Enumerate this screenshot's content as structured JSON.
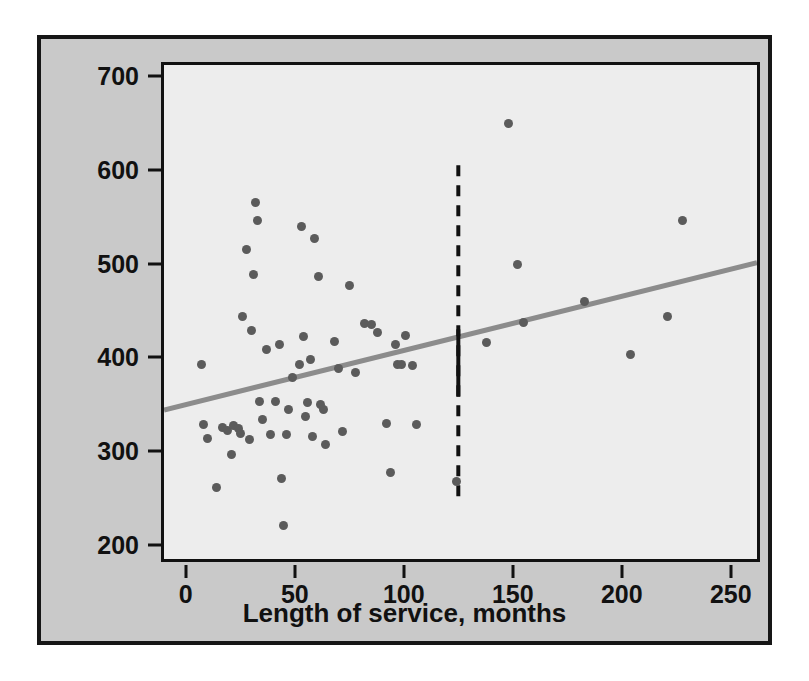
{
  "chart_data": {
    "type": "scatter",
    "title": "",
    "xlabel": "Length of service, months",
    "ylabel": "Weekly earnings, dollars",
    "xlim": [
      -10,
      262
    ],
    "ylim": [
      185,
      712
    ],
    "xticks": [
      0,
      50,
      100,
      150,
      200,
      250
    ],
    "yticks": [
      200,
      300,
      400,
      500,
      600,
      700
    ],
    "grid": false,
    "legend": "none",
    "point_color": "#5b5b5b",
    "background_color": "#ededed",
    "frame_color": "#c9c9c9",
    "axis_color": "#111111",
    "points": [
      {
        "x": 7,
        "y": 393
      },
      {
        "x": 8,
        "y": 328
      },
      {
        "x": 10,
        "y": 314
      },
      {
        "x": 14,
        "y": 261
      },
      {
        "x": 17,
        "y": 325
      },
      {
        "x": 19,
        "y": 322
      },
      {
        "x": 21,
        "y": 296
      },
      {
        "x": 22,
        "y": 327
      },
      {
        "x": 24,
        "y": 324
      },
      {
        "x": 25,
        "y": 319
      },
      {
        "x": 26,
        "y": 444
      },
      {
        "x": 28,
        "y": 515
      },
      {
        "x": 29,
        "y": 312
      },
      {
        "x": 30,
        "y": 429
      },
      {
        "x": 31,
        "y": 489
      },
      {
        "x": 32,
        "y": 565
      },
      {
        "x": 33,
        "y": 546
      },
      {
        "x": 34,
        "y": 353
      },
      {
        "x": 35,
        "y": 334
      },
      {
        "x": 37,
        "y": 408
      },
      {
        "x": 39,
        "y": 318
      },
      {
        "x": 41,
        "y": 353
      },
      {
        "x": 43,
        "y": 414
      },
      {
        "x": 44,
        "y": 271
      },
      {
        "x": 45,
        "y": 221
      },
      {
        "x": 46,
        "y": 318
      },
      {
        "x": 47,
        "y": 345
      },
      {
        "x": 49,
        "y": 379
      },
      {
        "x": 52,
        "y": 393
      },
      {
        "x": 53,
        "y": 540
      },
      {
        "x": 54,
        "y": 422
      },
      {
        "x": 55,
        "y": 337
      },
      {
        "x": 56,
        "y": 352
      },
      {
        "x": 57,
        "y": 398
      },
      {
        "x": 58,
        "y": 316
      },
      {
        "x": 59,
        "y": 527
      },
      {
        "x": 61,
        "y": 486
      },
      {
        "x": 62,
        "y": 350
      },
      {
        "x": 63,
        "y": 345
      },
      {
        "x": 64,
        "y": 307
      },
      {
        "x": 68,
        "y": 417
      },
      {
        "x": 70,
        "y": 388
      },
      {
        "x": 72,
        "y": 321
      },
      {
        "x": 75,
        "y": 477
      },
      {
        "x": 78,
        "y": 384
      },
      {
        "x": 82,
        "y": 436
      },
      {
        "x": 85,
        "y": 435
      },
      {
        "x": 88,
        "y": 427
      },
      {
        "x": 92,
        "y": 330
      },
      {
        "x": 94,
        "y": 277
      },
      {
        "x": 96,
        "y": 414
      },
      {
        "x": 97,
        "y": 393
      },
      {
        "x": 99,
        "y": 392
      },
      {
        "x": 101,
        "y": 423
      },
      {
        "x": 104,
        "y": 391
      },
      {
        "x": 106,
        "y": 329
      },
      {
        "x": 124,
        "y": 268
      },
      {
        "x": 138,
        "y": 416
      },
      {
        "x": 148,
        "y": 650
      },
      {
        "x": 152,
        "y": 499
      },
      {
        "x": 155,
        "y": 437
      },
      {
        "x": 183,
        "y": 460
      },
      {
        "x": 204,
        "y": 403
      },
      {
        "x": 221,
        "y": 444
      },
      {
        "x": 228,
        "y": 546
      }
    ],
    "regression_line": {
      "color": "#8c8c8c",
      "x_start": -10,
      "y_start": 344,
      "x_end": 262,
      "y_end": 501
    },
    "vertical_reference_line": {
      "x": 125,
      "y_top": 605,
      "y_bottom": 250,
      "style": "dashed",
      "color": "#111111",
      "solid_segment": {
        "y_top": 430,
        "y_bottom": 358
      }
    }
  }
}
